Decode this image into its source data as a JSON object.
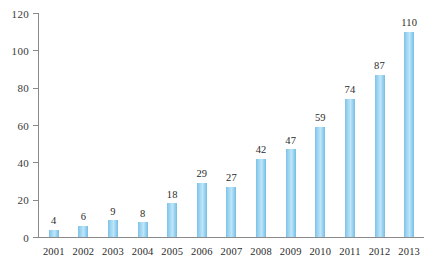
{
  "chart_data": {
    "type": "bar",
    "title": "",
    "subtitle": "",
    "xlabel": "",
    "ylabel": "",
    "categories": [
      "2001",
      "2002",
      "2003",
      "2004",
      "2005",
      "2006",
      "2007",
      "2008",
      "2009",
      "2010",
      "2011",
      "2012",
      "2013"
    ],
    "values": [
      4,
      6,
      9,
      8,
      18,
      29,
      27,
      42,
      47,
      59,
      74,
      87,
      110
    ],
    "data_labels": [
      "4",
      "6",
      "9",
      "8",
      "18",
      "29",
      "27",
      "42",
      "47",
      "59",
      "74",
      "87",
      "110"
    ],
    "ylim": [
      0,
      120
    ],
    "y_ticks": [
      0,
      20,
      40,
      60,
      80,
      100,
      120
    ],
    "y_tick_labels": [
      "0",
      "20",
      "40",
      "60",
      "80",
      "100",
      "120"
    ],
    "grid": false,
    "legend": null,
    "legend_position": "none",
    "bar_color": "#9fd6f2",
    "axis_color": "#8a8a8a",
    "text_color": "#2b2b2b",
    "background_color": "#ffffff"
  }
}
